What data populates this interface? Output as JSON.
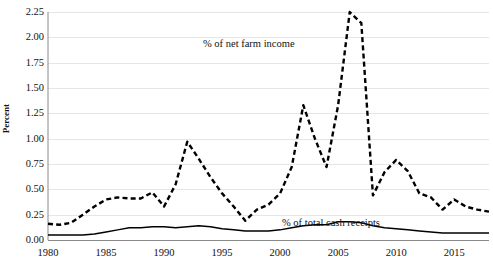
{
  "chart_data": {
    "type": "line",
    "title": "",
    "xlabel": "",
    "ylabel": "Percent",
    "xlim": [
      1980,
      2018
    ],
    "ylim": [
      0,
      2.25
    ],
    "grid": true,
    "legend_position": "inline-annotations",
    "xticks": [
      1980,
      1985,
      1990,
      1995,
      2000,
      2005,
      2010,
      2015
    ],
    "yticks": [
      "0.00",
      "0.25",
      "0.50",
      "0.75",
      "1.00",
      "1.25",
      "1.50",
      "1.75",
      "2.00",
      "2.25"
    ],
    "x": [
      1980,
      1981,
      1982,
      1983,
      1984,
      1985,
      1986,
      1987,
      1988,
      1989,
      1990,
      1991,
      1992,
      1993,
      1994,
      1995,
      1996,
      1997,
      1998,
      1999,
      2000,
      2001,
      2002,
      2003,
      2004,
      2005,
      2006,
      2007,
      2008,
      2009,
      2010,
      2011,
      2012,
      2013,
      2014,
      2015,
      2016,
      2017,
      2018
    ],
    "series": [
      {
        "name": "% of net farm income",
        "style": "dashed",
        "color": "#000000",
        "values": [
          0.16,
          0.15,
          0.17,
          0.25,
          0.33,
          0.4,
          0.42,
          0.41,
          0.41,
          0.47,
          0.33,
          0.55,
          0.97,
          0.8,
          0.62,
          0.46,
          0.33,
          0.19,
          0.3,
          0.35,
          0.46,
          0.72,
          1.33,
          1.0,
          0.72,
          1.33,
          2.25,
          2.14,
          0.44,
          0.67,
          0.79,
          0.68,
          0.46,
          0.42,
          0.3,
          0.4,
          0.33,
          0.3,
          0.28
        ]
      },
      {
        "name": "% of total cash receipts",
        "style": "solid",
        "color": "#000000",
        "values": [
          0.05,
          0.05,
          0.05,
          0.05,
          0.06,
          0.08,
          0.1,
          0.12,
          0.12,
          0.13,
          0.13,
          0.12,
          0.13,
          0.14,
          0.13,
          0.11,
          0.1,
          0.09,
          0.09,
          0.09,
          0.1,
          0.12,
          0.14,
          0.15,
          0.15,
          0.18,
          0.18,
          0.17,
          0.14,
          0.12,
          0.11,
          0.1,
          0.09,
          0.08,
          0.07,
          0.07,
          0.07,
          0.07,
          0.07
        ]
      }
    ],
    "annotations": [
      {
        "text": "% of net farm income",
        "x": 2002,
        "y": 1.9
      },
      {
        "text": "% of total cash receipts",
        "x": 2011,
        "y": 0.33
      }
    ]
  }
}
